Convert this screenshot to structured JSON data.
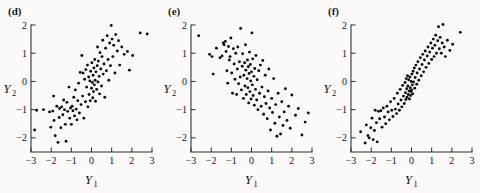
{
  "figure": {
    "background_color": "#fbfaf8",
    "ink_color": "#0d0d0d",
    "panel_count": 3
  },
  "panels": [
    {
      "label": "(d)",
      "name": "panel-d",
      "xlabel": "Y",
      "xlabel_sub": "1",
      "ylabel": "Y",
      "ylabel_sub": "2"
    },
    {
      "label": "(e)",
      "name": "panel-e",
      "xlabel": "Y",
      "xlabel_sub": "1",
      "ylabel": "Y",
      "ylabel_sub": "2"
    },
    {
      "label": "(f)",
      "name": "panel-f",
      "xlabel": "Y",
      "xlabel_sub": "1",
      "ylabel": "Y",
      "ylabel_sub": "2"
    }
  ],
  "chart_data": [
    {
      "type": "scatter",
      "title": "(d)",
      "xlabel": "Y1",
      "ylabel": "Y2",
      "xlim": [
        -3,
        3
      ],
      "ylim": [
        -2.5,
        2
      ],
      "xticks": [
        -3,
        -2,
        -1,
        0,
        1,
        2,
        3
      ],
      "yticks": [
        -2,
        -1,
        0,
        1,
        2
      ],
      "grid": false,
      "legend": "none",
      "correlation": 0.7,
      "n_points": 103,
      "points": [
        [
          -2.82,
          -1.72
        ],
        [
          -2.72,
          -1.02
        ],
        [
          -2.38,
          -1.0
        ],
        [
          -2.08,
          -1.08
        ],
        [
          -2.02,
          -1.62
        ],
        [
          -1.92,
          -1.05
        ],
        [
          -1.88,
          -0.52
        ],
        [
          -1.86,
          -1.38
        ],
        [
          -1.8,
          -1.92
        ],
        [
          -1.72,
          -0.88
        ],
        [
          -1.66,
          -2.16
        ],
        [
          -1.6,
          -1.28
        ],
        [
          -1.58,
          -0.96
        ],
        [
          -1.52,
          -1.64
        ],
        [
          -1.48,
          -0.9
        ],
        [
          -1.42,
          -1.18
        ],
        [
          -1.38,
          -0.66
        ],
        [
          -1.34,
          -1.0
        ],
        [
          -1.3,
          -1.52
        ],
        [
          -1.26,
          -2.12
        ],
        [
          -1.22,
          -0.74
        ],
        [
          -1.18,
          -1.06
        ],
        [
          -1.12,
          -0.2
        ],
        [
          -1.08,
          -1.3
        ],
        [
          -1.04,
          -0.94
        ],
        [
          -1.0,
          -1.52
        ],
        [
          -0.96,
          -0.88
        ],
        [
          -0.92,
          -1.04
        ],
        [
          -0.88,
          -0.56
        ],
        [
          -0.84,
          -1.22
        ],
        [
          -0.8,
          -0.3
        ],
        [
          -0.76,
          -0.98
        ],
        [
          -0.72,
          -1.36
        ],
        [
          -0.68,
          -0.68
        ],
        [
          -0.64,
          -0.06
        ],
        [
          -0.6,
          -1.12
        ],
        [
          -0.56,
          0.32
        ],
        [
          -0.52,
          -0.82
        ],
        [
          -0.48,
          0.92
        ],
        [
          -0.44,
          -0.52
        ],
        [
          -0.42,
          0.3
        ],
        [
          -0.38,
          -1.3
        ],
        [
          -0.34,
          0.08
        ],
        [
          -0.3,
          -0.72
        ],
        [
          -0.28,
          0.42
        ],
        [
          -0.24,
          -0.2
        ],
        [
          -0.2,
          0.58
        ],
        [
          -0.18,
          -0.9
        ],
        [
          -0.14,
          0.16
        ],
        [
          -0.12,
          -0.46
        ],
        [
          -0.08,
          0.02
        ],
        [
          -0.06,
          -0.68
        ],
        [
          -0.04,
          0.36
        ],
        [
          0.0,
          -0.24
        ],
        [
          0.02,
          0.66
        ],
        [
          0.04,
          -0.04
        ],
        [
          0.06,
          -0.58
        ],
        [
          0.08,
          0.22
        ],
        [
          0.1,
          -0.36
        ],
        [
          0.12,
          0.48
        ],
        [
          0.14,
          -0.12
        ],
        [
          0.16,
          0.78
        ],
        [
          0.18,
          0.04
        ],
        [
          0.2,
          -0.7
        ],
        [
          0.22,
          0.34
        ],
        [
          0.26,
          -0.28
        ],
        [
          0.28,
          0.56
        ],
        [
          0.3,
          1.22
        ],
        [
          0.32,
          -0.02
        ],
        [
          0.34,
          0.72
        ],
        [
          0.38,
          0.18
        ],
        [
          0.4,
          -0.44
        ],
        [
          0.42,
          1.02
        ],
        [
          0.46,
          0.44
        ],
        [
          0.5,
          -0.16
        ],
        [
          0.52,
          0.88
        ],
        [
          0.56,
          1.46
        ],
        [
          0.58,
          0.26
        ],
        [
          0.62,
          0.62
        ],
        [
          0.66,
          -0.56
        ],
        [
          0.7,
          1.18
        ],
        [
          0.74,
          0.38
        ],
        [
          0.78,
          1.62
        ],
        [
          0.82,
          0.78
        ],
        [
          0.86,
          0.04
        ],
        [
          0.9,
          1.36
        ],
        [
          0.94,
          0.56
        ],
        [
          0.98,
          1.98
        ],
        [
          1.02,
          1.5
        ],
        [
          1.06,
          0.88
        ],
        [
          1.1,
          1.28
        ],
        [
          1.16,
          0.3
        ],
        [
          1.2,
          1.66
        ],
        [
          1.28,
          1.08
        ],
        [
          1.34,
          1.44
        ],
        [
          1.4,
          0.58
        ],
        [
          1.5,
          1.22
        ],
        [
          1.62,
          0.96
        ],
        [
          1.78,
          1.06
        ],
        [
          1.88,
          0.4
        ],
        [
          2.04,
          0.92
        ],
        [
          2.42,
          1.72
        ],
        [
          2.76,
          1.68
        ]
      ]
    },
    {
      "type": "scatter",
      "title": "(e)",
      "xlabel": "Y1",
      "ylabel": "Y2",
      "xlim": [
        -3,
        3
      ],
      "ylim": [
        -2.5,
        2
      ],
      "xticks": [
        -3,
        -2,
        -1,
        0,
        1,
        2,
        3
      ],
      "yticks": [
        -2,
        -1,
        0,
        1,
        2
      ],
      "grid": false,
      "legend": "none",
      "correlation": -0.7,
      "n_points": 101,
      "points": [
        [
          -2.62,
          1.62
        ],
        [
          -2.08,
          0.96
        ],
        [
          -1.96,
          0.88
        ],
        [
          -1.9,
          0.26
        ],
        [
          -1.74,
          1.18
        ],
        [
          -1.56,
          0.84
        ],
        [
          -1.46,
          0.9
        ],
        [
          -1.4,
          1.36
        ],
        [
          -1.36,
          1.3
        ],
        [
          -1.3,
          1.42
        ],
        [
          -1.26,
          1.06
        ],
        [
          -1.22,
          0.38
        ],
        [
          -1.18,
          -0.06
        ],
        [
          -1.14,
          1.24
        ],
        [
          -1.1,
          0.76
        ],
        [
          -1.06,
          0.88
        ],
        [
          -1.02,
          1.54
        ],
        [
          -0.98,
          0.3
        ],
        [
          -0.94,
          -0.42
        ],
        [
          -0.9,
          1.16
        ],
        [
          -0.86,
          0.62
        ],
        [
          -0.82,
          0.08
        ],
        [
          -0.78,
          1.0
        ],
        [
          -0.74,
          -0.46
        ],
        [
          -0.7,
          0.44
        ],
        [
          -0.68,
          1.22
        ],
        [
          -0.64,
          -0.08
        ],
        [
          -0.6,
          0.7
        ],
        [
          -0.56,
          0.16
        ],
        [
          -0.54,
          1.88
        ],
        [
          -0.5,
          -0.3
        ],
        [
          -0.46,
          0.54
        ],
        [
          -0.44,
          0.98
        ],
        [
          -0.4,
          -0.6
        ],
        [
          -0.38,
          0.22
        ],
        [
          -0.34,
          0.66
        ],
        [
          -0.32,
          -0.16
        ],
        [
          -0.3,
          1.3
        ],
        [
          -0.28,
          0.4
        ],
        [
          -0.26,
          -0.46
        ],
        [
          -0.22,
          0.1
        ],
        [
          -0.2,
          0.76
        ],
        [
          -0.18,
          -0.22
        ],
        [
          -0.16,
          0.52
        ],
        [
          -0.14,
          -0.76
        ],
        [
          -0.12,
          0.28
        ],
        [
          -0.1,
          1.04
        ],
        [
          -0.08,
          -0.36
        ],
        [
          -0.06,
          0.6
        ],
        [
          -0.04,
          0.02
        ],
        [
          -0.02,
          -0.62
        ],
        [
          0.0,
          0.34
        ],
        [
          0.02,
          1.72
        ],
        [
          0.04,
          -0.12
        ],
        [
          0.06,
          0.8
        ],
        [
          0.08,
          -0.5
        ],
        [
          0.12,
          0.18
        ],
        [
          0.14,
          -0.84
        ],
        [
          0.16,
          0.46
        ],
        [
          0.2,
          -0.28
        ],
        [
          0.22,
          0.92
        ],
        [
          0.26,
          -0.66
        ],
        [
          0.28,
          0.06
        ],
        [
          0.32,
          -1.0
        ],
        [
          0.36,
          0.38
        ],
        [
          0.4,
          -0.42
        ],
        [
          0.44,
          0.58
        ],
        [
          0.48,
          -0.88
        ],
        [
          0.52,
          -0.2
        ],
        [
          0.56,
          0.74
        ],
        [
          0.6,
          -1.16
        ],
        [
          0.64,
          -0.54
        ],
        [
          0.68,
          0.22
        ],
        [
          0.72,
          -0.78
        ],
        [
          0.78,
          -1.32
        ],
        [
          0.82,
          -0.34
        ],
        [
          0.86,
          0.44
        ],
        [
          0.9,
          -0.94
        ],
        [
          0.94,
          -1.72
        ],
        [
          1.0,
          -0.6
        ],
        [
          1.04,
          -1.1
        ],
        [
          1.1,
          0.1
        ],
        [
          1.16,
          -1.48
        ],
        [
          1.2,
          -0.82
        ],
        [
          1.26,
          -1.94
        ],
        [
          1.32,
          -0.42
        ],
        [
          1.38,
          -1.26
        ],
        [
          1.44,
          -1.86
        ],
        [
          1.5,
          -0.72
        ],
        [
          1.56,
          -1.56
        ],
        [
          1.62,
          -1.08
        ],
        [
          1.68,
          -0.26
        ],
        [
          1.76,
          -1.38
        ],
        [
          1.84,
          -0.88
        ],
        [
          1.92,
          -1.66
        ],
        [
          2.0,
          -0.48
        ],
        [
          2.18,
          -1.2
        ],
        [
          2.32,
          -0.96
        ],
        [
          2.5,
          -1.9
        ],
        [
          2.66,
          -1.44
        ],
        [
          2.82,
          -1.12
        ]
      ]
    },
    {
      "type": "scatter",
      "title": "(f)",
      "xlabel": "Y1",
      "ylabel": "Y2",
      "xlim": [
        -3,
        3
      ],
      "ylim": [
        -2.5,
        2
      ],
      "xticks": [
        -3,
        -2,
        -1,
        0,
        1,
        2,
        3
      ],
      "yticks": [
        -2,
        -1,
        0,
        1,
        2
      ],
      "grid": false,
      "legend": "none",
      "correlation": 0.88,
      "n_points": 102,
      "points": [
        [
          -2.52,
          -1.78
        ],
        [
          -2.3,
          -2.18
        ],
        [
          -2.24,
          -1.54
        ],
        [
          -2.16,
          -1.92
        ],
        [
          -2.1,
          -2.0
        ],
        [
          -2.02,
          -1.64
        ],
        [
          -1.96,
          -1.3
        ],
        [
          -1.9,
          -2.06
        ],
        [
          -1.84,
          -1.74
        ],
        [
          -1.8,
          -1.02
        ],
        [
          -1.74,
          -1.46
        ],
        [
          -1.7,
          -2.14
        ],
        [
          -1.64,
          -1.06
        ],
        [
          -1.58,
          -1.32
        ],
        [
          -1.52,
          -1.04
        ],
        [
          -1.46,
          -1.62
        ],
        [
          -1.4,
          -0.94
        ],
        [
          -1.34,
          -1.26
        ],
        [
          -1.28,
          -1.5
        ],
        [
          -1.22,
          -0.88
        ],
        [
          -1.16,
          -1.08
        ],
        [
          -1.1,
          -1.36
        ],
        [
          -1.04,
          -0.72
        ],
        [
          -0.98,
          -1.02
        ],
        [
          -0.92,
          -1.24
        ],
        [
          -0.86,
          -0.6
        ],
        [
          -0.8,
          -0.98
        ],
        [
          -0.74,
          -1.14
        ],
        [
          -0.7,
          -0.42
        ],
        [
          -0.66,
          -0.8
        ],
        [
          -0.6,
          -1.02
        ],
        [
          -0.56,
          -0.28
        ],
        [
          -0.52,
          -0.66
        ],
        [
          -0.48,
          -0.9
        ],
        [
          -0.44,
          -0.14
        ],
        [
          -0.4,
          -0.52
        ],
        [
          -0.36,
          -0.78
        ],
        [
          -0.32,
          -0.04
        ],
        [
          -0.3,
          -0.4
        ],
        [
          -0.28,
          -0.64
        ],
        [
          -0.26,
          0.1
        ],
        [
          -0.24,
          -0.26
        ],
        [
          -0.22,
          -0.56
        ],
        [
          -0.2,
          0.2
        ],
        [
          -0.18,
          -0.16
        ],
        [
          -0.16,
          -0.46
        ],
        [
          -0.14,
          0.06
        ],
        [
          -0.12,
          -0.34
        ],
        [
          -0.1,
          -0.62
        ],
        [
          -0.08,
          0.16
        ],
        [
          -0.06,
          -0.22
        ],
        [
          -0.04,
          -0.5
        ],
        [
          -0.02,
          0.0
        ],
        [
          0.0,
          -0.3
        ],
        [
          0.02,
          0.26
        ],
        [
          0.04,
          -0.12
        ],
        [
          0.06,
          -0.44
        ],
        [
          0.08,
          0.36
        ],
        [
          0.1,
          -0.02
        ],
        [
          0.14,
          0.48
        ],
        [
          0.16,
          -0.24
        ],
        [
          0.18,
          0.14
        ],
        [
          0.22,
          0.58
        ],
        [
          0.26,
          -0.1
        ],
        [
          0.28,
          0.3
        ],
        [
          0.32,
          0.7
        ],
        [
          0.36,
          0.04
        ],
        [
          0.4,
          0.44
        ],
        [
          0.44,
          0.84
        ],
        [
          0.48,
          0.2
        ],
        [
          0.52,
          0.6
        ],
        [
          0.56,
          0.96
        ],
        [
          0.6,
          0.34
        ],
        [
          0.64,
          0.76
        ],
        [
          0.68,
          1.08
        ],
        [
          0.72,
          0.5
        ],
        [
          0.78,
          0.9
        ],
        [
          0.82,
          1.22
        ],
        [
          0.86,
          0.64
        ],
        [
          0.9,
          1.04
        ],
        [
          0.96,
          1.36
        ],
        [
          1.0,
          0.78
        ],
        [
          1.04,
          1.18
        ],
        [
          1.08,
          1.5
        ],
        [
          1.12,
          0.88
        ],
        [
          1.16,
          1.28
        ],
        [
          1.2,
          1.64
        ],
        [
          1.24,
          1.0
        ],
        [
          1.3,
          1.44
        ],
        [
          1.34,
          1.94
        ],
        [
          1.38,
          1.16
        ],
        [
          1.42,
          1.56
        ],
        [
          1.48,
          1.0
        ],
        [
          1.52,
          1.36
        ],
        [
          1.56,
          2.02
        ],
        [
          1.62,
          1.22
        ],
        [
          1.68,
          0.88
        ],
        [
          1.78,
          1.46
        ],
        [
          1.9,
          1.1
        ],
        [
          2.04,
          1.32
        ],
        [
          2.42,
          1.74
        ],
        [
          -0.02,
          -0.36
        ]
      ]
    }
  ]
}
